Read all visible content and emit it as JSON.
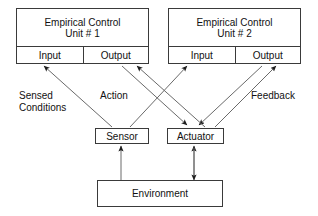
{
  "diagram": {
    "stroke_color": "#3a3a3a",
    "text_color": "#111111",
    "background": "#ffffff",
    "units": [
      {
        "id": "unit-1",
        "title_line1": "Empirical Control",
        "title_line2": "Unit # 1",
        "input_label": "Input",
        "output_label": "Output"
      },
      {
        "id": "unit-2",
        "title_line1": "Empirical Control",
        "title_line2": "Unit # 2",
        "input_label": "Input",
        "output_label": "Output"
      }
    ],
    "nodes": {
      "sensor": "Sensor",
      "actuator": "Actuator",
      "environment": "Environment"
    },
    "edge_labels": {
      "sensed_line1": "Sensed",
      "sensed_line2": "Conditions",
      "action": "Action",
      "feedback": "Feedback"
    }
  }
}
